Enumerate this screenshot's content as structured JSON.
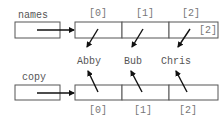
{
  "diagram": {
    "variables": [
      {
        "name": "names",
        "label": "names"
      },
      {
        "name": "copy",
        "label": "copy"
      }
    ],
    "top_array": {
      "indices": [
        "[0]",
        "[1]",
        "[2]"
      ],
      "extra_label": "[2]"
    },
    "bottom_array": {
      "indices": [
        "[0]",
        "[1]",
        "[2]"
      ]
    },
    "strings": [
      "Abby",
      "Bub",
      "Chris"
    ],
    "colors": {
      "stroke": "#555555",
      "arrow": "#111111",
      "text": "#555555",
      "background": "#ffffff"
    }
  }
}
